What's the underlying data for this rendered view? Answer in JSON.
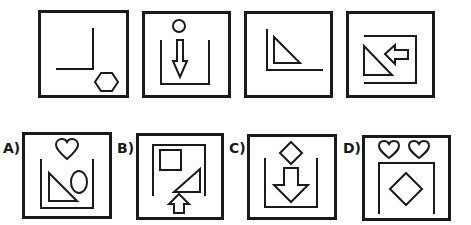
{
  "puzzle": {
    "type": "figure-sequence",
    "sequence": [
      {
        "index": 1,
        "elements": [
          "corner-lines",
          "hexagon"
        ]
      },
      {
        "index": 2,
        "elements": [
          "u-bracket",
          "circle",
          "down-arrow"
        ]
      },
      {
        "index": 3,
        "elements": [
          "corner-lines",
          "right-triangle"
        ]
      },
      {
        "index": 4,
        "elements": [
          "c-bracket",
          "right-triangle",
          "left-arrow"
        ]
      }
    ],
    "options": [
      {
        "label": "A)",
        "elements": [
          "u-bracket",
          "heart",
          "right-triangle",
          "ellipse"
        ]
      },
      {
        "label": "B)",
        "elements": [
          "n-bracket",
          "square",
          "right-triangle",
          "up-arrow"
        ]
      },
      {
        "label": "C)",
        "elements": [
          "u-bracket",
          "diamond",
          "down-arrow"
        ]
      },
      {
        "label": "D)",
        "elements": [
          "n-bracket",
          "heart",
          "heart",
          "diamond"
        ]
      }
    ]
  },
  "colors": {
    "stroke": "#1a1a1a",
    "background": "#ffffff"
  }
}
